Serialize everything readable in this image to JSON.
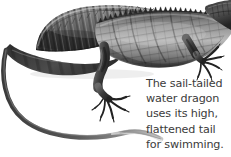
{
  "figure": {
    "medium": "grayscale-scientific-illustration",
    "background_color": "#ffffff",
    "ink_color": "#2b2b2b",
    "midtone_color": "#6e6e6e",
    "highlight_color": "#cfcfcf"
  },
  "caption": {
    "text_color": "#3b3b3b",
    "lines": [
      "The sail-tailed",
      "water dragon",
      "uses its high,",
      "flattened tail",
      "for swimming."
    ],
    "full_text": "The sail-tailed water dragon uses its high, flattened tail for swimming."
  },
  "anatomy": {
    "sail_label": "sail-fin",
    "head_label": "head",
    "foreleg_label": "foreleg",
    "hindleg_label": "hindleg",
    "tail_label": "tail",
    "spines_label": "dorsal-spines"
  }
}
